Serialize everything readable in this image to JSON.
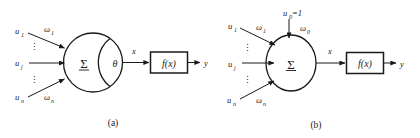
{
  "figure": {
    "caption_a": "(a)",
    "caption_b": "(b)",
    "background_color": "#ffffff",
    "ink_color": "#1a1a1a"
  },
  "panel_a": {
    "caption": "(a)",
    "inputs": [
      {
        "signal": "u",
        "signal_sub": "1",
        "weight": "ω",
        "weight_sub": "1"
      },
      {
        "signal": "u",
        "signal_sub": "j",
        "weight": "",
        "weight_sub": ""
      },
      {
        "signal": "u",
        "signal_sub": "n",
        "weight": "ω",
        "weight_sub": "n"
      }
    ],
    "vertical_dots": "⋮",
    "summation_symbol": "Σ",
    "threshold_symbol": "θ",
    "net_input_label": "x",
    "activation_box_label": "f(x)",
    "output_label": "y"
  },
  "panel_b": {
    "caption": "(b)",
    "bias_input_label": "u",
    "bias_input_sub": "0",
    "bias_input_value": "=1",
    "bias_weight": "ω",
    "bias_weight_sub": "0",
    "inputs": [
      {
        "signal": "u",
        "signal_sub": "1",
        "weight": "ω",
        "weight_sub": "1"
      },
      {
        "signal": "u",
        "signal_sub": "j",
        "weight": "",
        "weight_sub": ""
      },
      {
        "signal": "u",
        "signal_sub": "n",
        "weight": "ω",
        "weight_sub": "n"
      }
    ],
    "vertical_dots": "⋮",
    "summation_symbol": "Σ",
    "net_input_label": "x",
    "activation_box_label": "f(x)",
    "output_label": "y"
  }
}
